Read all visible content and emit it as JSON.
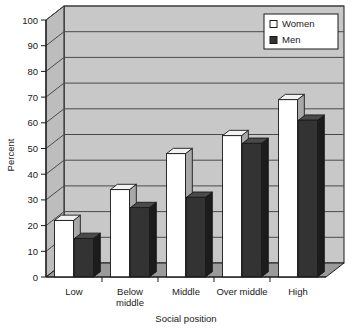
{
  "chart_data": {
    "type": "bar",
    "title": "",
    "subtitle": "",
    "xlabel": "Social position",
    "ylabel": "Percent",
    "categories": [
      "Low",
      "Below middle",
      "Middle",
      "Over middle",
      "High"
    ],
    "series": [
      {
        "name": "Women",
        "values": [
          22,
          34,
          48,
          55,
          69
        ],
        "color": "#ffffff"
      },
      {
        "name": "Men",
        "values": [
          15,
          27,
          31,
          52,
          61
        ],
        "color": "#333333"
      }
    ],
    "ylim": [
      0,
      100
    ],
    "yticks": [
      0,
      10,
      20,
      30,
      40,
      50,
      60,
      70,
      80,
      90,
      100
    ],
    "ytick_labels": [
      "0",
      "10",
      "20",
      "30",
      "40",
      "50",
      "60",
      "70",
      "80",
      "90",
      "100"
    ],
    "grid": true,
    "grid_axis": "y",
    "legend_position": "top-right",
    "style": "3d-columns",
    "plot_background": "#c8c8c8",
    "floor_color": "#9a9a9a",
    "gridline_color": "#4a4a4a",
    "axis_color": "#1a1a1a"
  },
  "legend": {
    "entries": [
      {
        "label": "Women",
        "swatch": "white-square"
      },
      {
        "label": "Men",
        "swatch": "black-square"
      }
    ]
  },
  "axes": {
    "y_title": "Percent",
    "x_title": "Social position"
  },
  "category_lines": {
    "low": [
      "Low"
    ],
    "below_middle": [
      "Below",
      "middle"
    ],
    "middle": [
      "Middle"
    ],
    "over_middle": [
      "Over middle"
    ],
    "high": [
      "High"
    ]
  }
}
